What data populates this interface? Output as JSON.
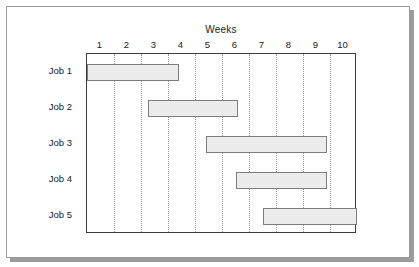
{
  "figure": {
    "title": "Weeks"
  },
  "chart_data": {
    "type": "bar",
    "subtype": "gantt",
    "title": "Weeks",
    "xlabel": "Weeks",
    "ylabel": "",
    "xlim": [
      0,
      10
    ],
    "xticklabels": [
      "1",
      "2",
      "3",
      "4",
      "5",
      "6",
      "7",
      "8",
      "9",
      "10"
    ],
    "xtick_style": "band-centered",
    "grid": true,
    "grid_axis": "x",
    "grid_style": "dotted",
    "legend": false,
    "categories": [
      "Job 1",
      "Job 2",
      "Job 3",
      "Job 4",
      "Job 5"
    ],
    "bars": [
      {
        "label": "Job 1",
        "start": 0.0,
        "end": 3.4,
        "duration": 3.4
      },
      {
        "label": "Job 2",
        "start": 2.25,
        "end": 5.6,
        "duration": 3.35
      },
      {
        "label": "Job 3",
        "start": 4.4,
        "end": 8.9,
        "duration": 4.5
      },
      {
        "label": "Job 4",
        "start": 5.5,
        "end": 8.9,
        "duration": 3.4
      },
      {
        "label": "Job 5",
        "start": 6.5,
        "end": 10.0,
        "duration": 3.5
      }
    ],
    "colors": {
      "bar_fill": "#ececec",
      "bar_border": "#7d7d7d",
      "axis": "#3c3c3c",
      "grid": "#9a9a9a",
      "text": "#1a1a1a",
      "background": "#ffffff"
    }
  }
}
